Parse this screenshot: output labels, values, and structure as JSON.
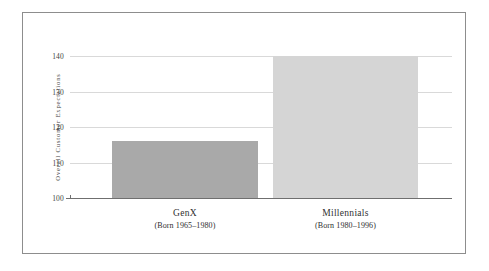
{
  "chart_data": {
    "type": "bar",
    "title": "",
    "xlabel": "",
    "ylabel": "Overall Customer Expectations",
    "categories": [
      "GenX",
      "Millennials"
    ],
    "category_sublabels": [
      "(Born 1965–1980)",
      "(Born 1980–1996)"
    ],
    "values": [
      116,
      140
    ],
    "ylim": [
      100,
      140
    ],
    "yticks": [
      100,
      110,
      120,
      130,
      140
    ],
    "ytick_labels": [
      "100",
      "110",
      "120",
      "130",
      "140"
    ],
    "grid": true,
    "grid_axis": "y",
    "legend": "none",
    "bar_colors": [
      "#a9a9a9",
      "#d5d5d5"
    ],
    "frame_color": "#8d8d8d",
    "gridline_color": "#d9d9d9",
    "axis_color": "#6f6f6f",
    "background": "#ffffff"
  },
  "axes": {
    "y": {
      "label": "Overall Customer Expectations",
      "ticks": [
        {
          "value": 140,
          "label": "140"
        },
        {
          "value": 130,
          "label": "130"
        },
        {
          "value": 120,
          "label": "120"
        },
        {
          "value": 110,
          "label": "110"
        },
        {
          "value": 100,
          "label": "100"
        }
      ]
    },
    "x": {
      "categories": [
        {
          "name": "GenX",
          "sub": "(Born 1965–1980)"
        },
        {
          "name": "Millennials",
          "sub": "(Born 1980–1996)"
        }
      ]
    }
  }
}
